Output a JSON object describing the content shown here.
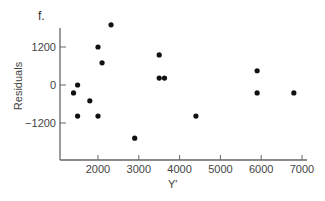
{
  "figure": {
    "panel_label": "f.",
    "xlabel": "Y′",
    "ylabel": "Residuals"
  },
  "chart_data": {
    "type": "scatter",
    "title": "",
    "panel_label": "f.",
    "xlabel": "Y′",
    "ylabel": "Residuals",
    "xlim": [
      1000,
      7300
    ],
    "ylim": [
      -2300,
      2200
    ],
    "xticks": [
      2000,
      3000,
      4000,
      5000,
      6000,
      7000
    ],
    "yticks": [
      1200,
      0,
      -1200
    ],
    "grid": false,
    "legend": null,
    "series": [
      {
        "name": "residuals",
        "color": "#111111",
        "points": [
          {
            "x": 2320,
            "y": 1900
          },
          {
            "x": 2000,
            "y": 1200
          },
          {
            "x": 2100,
            "y": 700
          },
          {
            "x": 1500,
            "y": 0
          },
          {
            "x": 1400,
            "y": -250
          },
          {
            "x": 1800,
            "y": -500
          },
          {
            "x": 1500,
            "y": -980
          },
          {
            "x": 2000,
            "y": -980
          },
          {
            "x": 2900,
            "y": -1680
          },
          {
            "x": 3500,
            "y": 950
          },
          {
            "x": 3500,
            "y": 220
          },
          {
            "x": 3630,
            "y": 220
          },
          {
            "x": 4400,
            "y": -980
          },
          {
            "x": 5900,
            "y": 450
          },
          {
            "x": 5900,
            "y": -250
          },
          {
            "x": 6800,
            "y": -250
          }
        ]
      }
    ]
  },
  "colors": {
    "axis": "#666666",
    "point": "#111111",
    "text": "#444444"
  }
}
